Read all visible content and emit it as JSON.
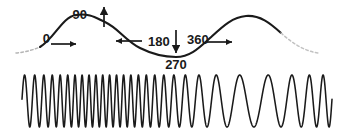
{
  "figure": {
    "title": "",
    "type": "frequency-modulation-diagram",
    "background_color": "#ffffff",
    "line_color": "#1a1a1a"
  },
  "chart_data": {
    "type": "line",
    "title": "",
    "subtitle": "",
    "xlabel": "",
    "ylabel": "",
    "grid": false,
    "legend": "none",
    "series": [
      {
        "name": "modulating-sine-wave",
        "description": "Upper smooth sine wave, one full cycle, solid with dashed fade at both ends",
        "style": "solid-with-dashed-ends",
        "x": [
          0,
          45,
          90,
          135,
          180,
          225,
          270,
          315,
          360
        ],
        "values": [
          0,
          0.707,
          1,
          0.707,
          0,
          -0.707,
          -1,
          -0.707,
          0
        ]
      },
      {
        "name": "fm-carrier-waveform",
        "description": "Lower carrier wave whose frequency follows the modulating wave amplitude: densest near 90 degrees, sparsest near 270 degrees",
        "style": "solid",
        "carrier_cycles": 28,
        "frequency_min_at_deg": 270,
        "frequency_max_at_deg": 90
      }
    ]
  },
  "annotations": {
    "phase_labels": [
      {
        "id": "deg-0",
        "text": "0",
        "degrees": 0,
        "position": "left-of-zero-crossing"
      },
      {
        "id": "deg-90",
        "text": "90",
        "degrees": 90,
        "position": "left-of-peak-arrow"
      },
      {
        "id": "deg-180",
        "text": "180",
        "degrees": 180,
        "position": "right-of-mid-crossing"
      },
      {
        "id": "deg-270",
        "text": "270",
        "degrees": 270,
        "position": "below-trough-arrow"
      },
      {
        "id": "deg-360",
        "text": "360",
        "degrees": 360,
        "position": "right-of-trough-arrow"
      }
    ],
    "arrows": [
      {
        "id": "arrow-0-right",
        "direction": "right",
        "at_label": "0",
        "meaning": "rising through zero"
      },
      {
        "id": "arrow-90-up",
        "direction": "up",
        "at_label": "90",
        "meaning": "maximum positive amplitude"
      },
      {
        "id": "arrow-180-left",
        "direction": "left",
        "at_label": "180",
        "meaning": "falling through zero"
      },
      {
        "id": "arrow-270-down",
        "direction": "down",
        "at_label": "270",
        "meaning": "maximum negative amplitude"
      },
      {
        "id": "arrow-360-right",
        "direction": "right",
        "at_label": "360",
        "meaning": "rising through zero, cycle repeats"
      }
    ]
  }
}
